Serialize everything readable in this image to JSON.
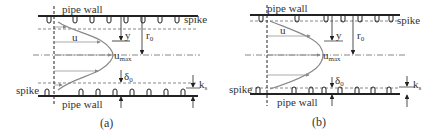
{
  "figure": {
    "colors": {
      "line": "#222222",
      "profile": "#888888",
      "dash": "#555555",
      "background": "#ffffff"
    },
    "panels": [
      {
        "id": "a",
        "caption": "(a)",
        "labels": {
          "top_wall": "pipe wall",
          "bottom_wall": "pipe wall",
          "spike_right": "spike",
          "spike_left": "spike",
          "u": "u",
          "y": "y",
          "r": "r",
          "r_sub": "0",
          "umax": "u",
          "umax_sub": "max",
          "delta": "δ",
          "delta_sub": "0",
          "k": "k",
          "k_sub": "s"
        }
      },
      {
        "id": "b",
        "caption": "(b)",
        "labels": {
          "top_wall": "pipe wall",
          "bottom_wall": "pipe wall",
          "spike_right": "spike",
          "spike_left": "spike",
          "u": "u",
          "y": "y",
          "r": "r",
          "r_sub": "0",
          "umax": "u",
          "umax_sub": "max",
          "delta": "δ",
          "delta_sub": "0",
          "k": "k",
          "k_sub": "s"
        }
      }
    ]
  }
}
